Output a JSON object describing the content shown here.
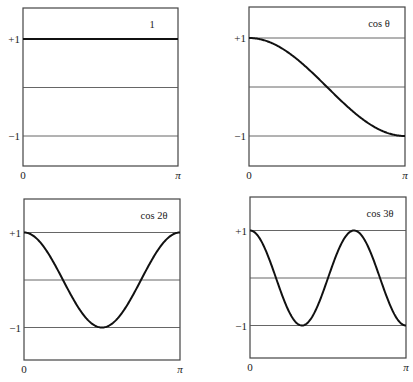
{
  "chart_data": [
    {
      "type": "line",
      "title": "1",
      "xlabel": "",
      "ylabel": "",
      "x_ticks": [
        "0",
        "π"
      ],
      "y_ticks": [
        "+1",
        "-1"
      ],
      "xlim": [
        0,
        3.14159
      ],
      "ylim": [
        -1.6,
        1.6
      ],
      "grid": "horizontal lines at +1, 0, -1",
      "series": [
        {
          "name": "1",
          "function": "1",
          "x": [
            0,
            0.785,
            1.571,
            2.356,
            3.142
          ],
          "y": [
            1,
            1,
            1,
            1,
            1
          ]
        }
      ]
    },
    {
      "type": "line",
      "title": "cos θ",
      "x_ticks": [
        "0",
        "π"
      ],
      "y_ticks": [
        "+1",
        "-1"
      ],
      "xlim": [
        0,
        3.14159
      ],
      "ylim": [
        -1.6,
        1.6
      ],
      "grid": "horizontal lines at +1, 0, -1",
      "series": [
        {
          "name": "cos θ",
          "function": "cos(x)",
          "x": [
            0,
            0.785,
            1.571,
            2.356,
            3.142
          ],
          "y": [
            1,
            0.707,
            0,
            -0.707,
            -1
          ]
        }
      ]
    },
    {
      "type": "line",
      "title": "cos 2θ",
      "x_ticks": [
        "0",
        "π"
      ],
      "y_ticks": [
        "+1",
        "-1"
      ],
      "xlim": [
        0,
        3.14159
      ],
      "ylim": [
        -1.6,
        1.6
      ],
      "grid": "horizontal lines at +1, 0, -1",
      "series": [
        {
          "name": "cos 2θ",
          "function": "cos(2x)",
          "x": [
            0,
            0.785,
            1.571,
            2.356,
            3.142
          ],
          "y": [
            1,
            0,
            -1,
            0,
            1
          ]
        }
      ]
    },
    {
      "type": "line",
      "title": "cos 3θ",
      "x_ticks": [
        "0",
        "π"
      ],
      "y_ticks": [
        "+1",
        "-1"
      ],
      "xlim": [
        0,
        3.14159
      ],
      "ylim": [
        -1.6,
        1.6
      ],
      "grid": "horizontal lines at +1, 0, -1",
      "series": [
        {
          "name": "cos 3θ",
          "function": "cos(3x)",
          "x": [
            0,
            0.524,
            1.047,
            1.571,
            2.094,
            2.618,
            3.142
          ],
          "y": [
            1,
            0,
            -1,
            0,
            1,
            0,
            -1
          ]
        }
      ]
    }
  ],
  "panels": [
    {
      "label": "1",
      "k": 0,
      "box": [
        23,
        8,
        178,
        166
      ],
      "ytop": 38.5
    },
    {
      "label": "cos θ",
      "k": 1,
      "box": [
        249,
        7,
        405,
        166
      ],
      "ytop": 37.5
    },
    {
      "label": "cos 2θ",
      "k": 2,
      "box": [
        24,
        199,
        180,
        360
      ],
      "ytop": 232
    },
    {
      "label": "cos 3θ",
      "k": 3,
      "box": [
        250,
        197,
        406,
        358
      ],
      "ytop": 230
    }
  ],
  "tick_labels": {
    "plus_one": "+1",
    "minus_one": "−1",
    "x_start": "0",
    "x_end": "π"
  },
  "colors": {
    "curve": "#111111",
    "grid": "#555555",
    "frame": "#444444"
  }
}
